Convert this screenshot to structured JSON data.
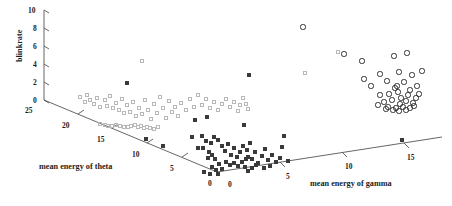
{
  "figure": {
    "width": 452,
    "height": 206,
    "background": "#ffffff"
  },
  "chart_data": {
    "type": "scatter",
    "projection": "3d",
    "title": "",
    "xlabel": "mean energy of gamma",
    "ylabel": "mean energy of theta",
    "zlabel": "blinkrate",
    "grid": false,
    "legend": "none",
    "axes": {
      "blinkrate": {
        "label": "blinkrate",
        "ticks": [
          0,
          2,
          4,
          6,
          8,
          10
        ],
        "tick_labels": [
          "0",
          "2",
          "4",
          "6",
          "8",
          "10"
        ],
        "range": [
          0,
          10
        ],
        "orientation": "vertical-left"
      },
      "mean_energy_of_theta": {
        "label": "mean energy of theta",
        "ticks": [
          25,
          20,
          15,
          10,
          5,
          0
        ],
        "tick_labels": [
          "25",
          "20",
          "15",
          "10",
          "5",
          "0"
        ],
        "range": [
          0,
          25
        ],
        "orientation": "depth-down-right"
      },
      "mean_energy_of_gamma": {
        "label": "mean energy of gamma",
        "ticks": [
          0,
          5,
          10,
          15
        ],
        "tick_labels": [
          "0",
          "5",
          "10",
          "15"
        ],
        "range": [
          0,
          18
        ],
        "orientation": "depth-up-right"
      }
    },
    "series": [
      {
        "name": "group-light-squares",
        "marker": "open-square",
        "color": "#b8b8b8",
        "points_px": [
          [
            80,
            97
          ],
          [
            85,
            102
          ],
          [
            87,
            95
          ],
          [
            90,
            100
          ],
          [
            94,
            104
          ],
          [
            97,
            98
          ],
          [
            100,
            107
          ],
          [
            105,
            100
          ],
          [
            107,
            106
          ],
          [
            110,
            96
          ],
          [
            113,
            108
          ],
          [
            116,
            103
          ],
          [
            119,
            110
          ],
          [
            122,
            99
          ],
          [
            124,
            113
          ],
          [
            127,
            105
          ],
          [
            130,
            112
          ],
          [
            133,
            102
          ],
          [
            136,
            116
          ],
          [
            139,
            108
          ],
          [
            142,
            61
          ],
          [
            142,
            114
          ],
          [
            145,
            100
          ],
          [
            148,
            110
          ],
          [
            151,
            119
          ],
          [
            154,
            104
          ],
          [
            157,
            113
          ],
          [
            160,
            97
          ],
          [
            163,
            108
          ],
          [
            166,
            118
          ],
          [
            169,
            101
          ],
          [
            172,
            112
          ],
          [
            175,
            107
          ],
          [
            178,
            116
          ],
          [
            181,
            103
          ],
          [
            186,
            110
          ],
          [
            190,
            99
          ],
          [
            194,
            107
          ],
          [
            198,
            95
          ],
          [
            202,
            105
          ],
          [
            206,
            99
          ],
          [
            210,
            108
          ],
          [
            214,
            102
          ],
          [
            218,
            110
          ],
          [
            222,
            104
          ],
          [
            226,
            99
          ],
          [
            230,
            107
          ],
          [
            234,
            102
          ],
          [
            238,
            111
          ],
          [
            240,
            105
          ],
          [
            243,
            98
          ],
          [
            246,
            104
          ],
          [
            248,
            109
          ],
          [
            116,
            125
          ],
          [
            120,
            126
          ],
          [
            124,
            127
          ],
          [
            128,
            127
          ],
          [
            131,
            126
          ],
          [
            135,
            125
          ],
          [
            138,
            127
          ],
          [
            141,
            126
          ],
          [
            144,
            128
          ],
          [
            147,
            127
          ],
          [
            150,
            128
          ],
          [
            100,
            124
          ],
          [
            105,
            125
          ],
          [
            108,
            126
          ],
          [
            112,
            126
          ],
          [
            154,
            129
          ],
          [
            158,
            127
          ],
          [
            305,
            73
          ],
          [
            338,
            52
          ]
        ]
      },
      {
        "name": "group-dark-squares",
        "marker": "filled-square",
        "color": "#3a3a3a",
        "points_px": [
          [
            127,
            83
          ],
          [
            146,
            139
          ],
          [
            163,
            146
          ],
          [
            195,
            120
          ],
          [
            207,
            117
          ],
          [
            192,
            137
          ],
          [
            202,
            136
          ],
          [
            206,
            141
          ],
          [
            211,
            143
          ],
          [
            214,
            137
          ],
          [
            198,
            148
          ],
          [
            203,
            148
          ],
          [
            209,
            152
          ],
          [
            218,
            140
          ],
          [
            222,
            146
          ],
          [
            225,
            151
          ],
          [
            228,
            144
          ],
          [
            231,
            155
          ],
          [
            234,
            148
          ],
          [
            237,
            157
          ],
          [
            240,
            152
          ],
          [
            243,
            146
          ],
          [
            246,
            159
          ],
          [
            226,
            162
          ],
          [
            230,
            165
          ],
          [
            234,
            163
          ],
          [
            238,
            166
          ],
          [
            242,
            162
          ],
          [
            245,
            167
          ],
          [
            248,
            157
          ],
          [
            219,
            164
          ],
          [
            222,
            169
          ],
          [
            216,
            170
          ],
          [
            212,
            167
          ],
          [
            247,
            150
          ],
          [
            250,
            143
          ],
          [
            252,
            159
          ],
          [
            255,
            152
          ],
          [
            258,
            163
          ],
          [
            262,
            156
          ],
          [
            244,
            125
          ],
          [
            249,
            75
          ],
          [
            265,
            149
          ],
          [
            268,
            160
          ],
          [
            272,
            155
          ],
          [
            276,
            162
          ],
          [
            280,
            158
          ],
          [
            264,
            168
          ],
          [
            270,
            166
          ],
          [
            248,
            171
          ],
          [
            252,
            168
          ],
          [
            256,
            165
          ],
          [
            212,
            155
          ],
          [
            215,
            159
          ],
          [
            208,
            158
          ],
          [
            282,
            147
          ],
          [
            288,
            161
          ],
          [
            204,
            172
          ],
          [
            210,
            174
          ],
          [
            218,
            174
          ],
          [
            402,
            140
          ],
          [
            284,
            136
          ]
        ]
      },
      {
        "name": "group-open-circles",
        "marker": "open-circle",
        "color": "#2e2e2e",
        "points_px": [
          [
            303,
            27
          ],
          [
            344,
            54
          ],
          [
            362,
            61
          ],
          [
            394,
            56
          ],
          [
            407,
            53
          ],
          [
            364,
            79
          ],
          [
            380,
            74
          ],
          [
            399,
            72
          ],
          [
            412,
            75
          ],
          [
            422,
            71
          ],
          [
            371,
            86
          ],
          [
            387,
            81
          ],
          [
            404,
            82
          ],
          [
            395,
            88
          ],
          [
            417,
            86
          ],
          [
            380,
            95
          ],
          [
            389,
            94
          ],
          [
            398,
            92
          ],
          [
            408,
            95
          ],
          [
            416,
            98
          ],
          [
            384,
            102
          ],
          [
            392,
            100
          ],
          [
            400,
            104
          ],
          [
            406,
            101
          ],
          [
            413,
            103
          ],
          [
            378,
            105
          ],
          [
            388,
            107
          ],
          [
            396,
            108
          ],
          [
            403,
            107
          ],
          [
            410,
            108
          ],
          [
            393,
            110
          ],
          [
            399,
            111
          ],
          [
            406,
            110
          ],
          [
            386,
            109
          ],
          [
            414,
            106
          ],
          [
            401,
            98
          ],
          [
            397,
            86
          ],
          [
            410,
            90
          ],
          [
            419,
            94
          ]
        ]
      }
    ]
  },
  "labels": {
    "y_axis_title": "blinkrate",
    "theta_axis_title": "mean energy of theta",
    "gamma_axis_title": "mean energy of gamma",
    "y_ticks": [
      "10",
      "8",
      "6",
      "4",
      "2",
      "0"
    ],
    "theta_ticks": [
      "25",
      "20",
      "15",
      "10",
      "5",
      "0"
    ],
    "gamma_ticks": [
      "0",
      "5",
      "10",
      "15"
    ]
  }
}
